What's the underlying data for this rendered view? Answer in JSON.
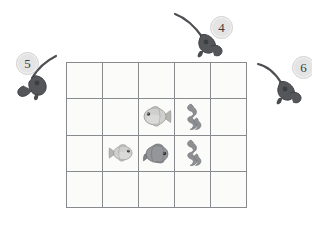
{
  "scene": {
    "title": "Fishing grid puzzle",
    "background_color": "#ffffff"
  },
  "grid": {
    "columns": 5,
    "rows": 4,
    "cell_fill_color": "#fbfbfa",
    "border_color": "#888b8d",
    "cells": [
      {
        "row": 1,
        "col": 1,
        "content": "",
        "label": ""
      },
      {
        "row": 1,
        "col": 2,
        "content": "",
        "label": ""
      },
      {
        "row": 1,
        "col": 3,
        "content": "",
        "label": ""
      },
      {
        "row": 1,
        "col": 4,
        "content": "",
        "label": ""
      },
      {
        "row": 1,
        "col": 5,
        "content": "",
        "label": ""
      },
      {
        "row": 2,
        "col": 1,
        "content": "",
        "label": ""
      },
      {
        "row": 2,
        "col": 2,
        "content": "",
        "label": ""
      },
      {
        "row": 2,
        "col": 3,
        "content": "fish-light",
        "label": "light gray fish facing right"
      },
      {
        "row": 2,
        "col": 4,
        "content": "seaweed",
        "label": "gray seaweed"
      },
      {
        "row": 2,
        "col": 5,
        "content": "",
        "label": ""
      },
      {
        "row": 3,
        "col": 1,
        "content": "",
        "label": ""
      },
      {
        "row": 3,
        "col": 2,
        "content": "fish-small",
        "label": "small gray fish facing left"
      },
      {
        "row": 3,
        "col": 3,
        "content": "fish-dark",
        "label": "dark gray fish facing right"
      },
      {
        "row": 3,
        "col": 4,
        "content": "seaweed",
        "label": "gray seaweed"
      },
      {
        "row": 3,
        "col": 5,
        "content": "",
        "label": ""
      },
      {
        "row": 4,
        "col": 1,
        "content": "",
        "label": ""
      },
      {
        "row": 4,
        "col": 2,
        "content": "",
        "label": ""
      },
      {
        "row": 4,
        "col": 3,
        "content": "",
        "label": ""
      },
      {
        "row": 4,
        "col": 4,
        "content": "",
        "label": ""
      },
      {
        "row": 4,
        "col": 5,
        "content": "",
        "label": ""
      }
    ]
  },
  "markers": [
    {
      "id": "marker-4",
      "number": "4",
      "icon": "fishing-rod-icon",
      "position": "top",
      "line_direction": "up-left"
    },
    {
      "id": "marker-5",
      "number": "5",
      "icon": "fishing-rod-icon",
      "position": "left",
      "line_direction": "up-right"
    },
    {
      "id": "marker-6",
      "number": "6",
      "icon": "fishing-rod-icon",
      "position": "right",
      "line_direction": "up-right"
    }
  ],
  "colors": {
    "badge_fill": "#e4e4e4",
    "badge_text": "#3b3b3b",
    "rod_dark": "#55565a",
    "fish_light": "#c9c9c7",
    "fish_dark": "#8e9094",
    "seaweed": "#8d8f93"
  }
}
